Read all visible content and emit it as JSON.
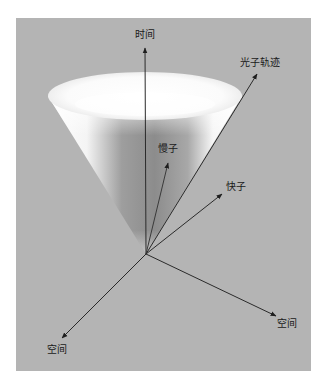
{
  "diagram": {
    "title": "",
    "background_color": "#b4b4b4",
    "labels": {
      "time_axis": "时间",
      "photon_path": "光子轨迹",
      "slow_particle": "慢子",
      "fast_particle": "快子",
      "space_axis_left": "空间",
      "space_axis_right": "空间"
    },
    "elements": [
      {
        "type": "cone",
        "name": "light-cone",
        "apex": [
          146,
          254
        ],
        "rim_center": [
          145,
          96
        ],
        "rim_rx": 97,
        "rim_ry": 24
      },
      {
        "type": "arrow",
        "name": "time-axis",
        "from": [
          146,
          254
        ],
        "to": [
          145,
          48
        ],
        "label": "时间"
      },
      {
        "type": "arrow",
        "name": "photon-trajectory",
        "from": [
          146,
          254
        ],
        "to": [
          257,
          74
        ],
        "label": "光子轨迹"
      },
      {
        "type": "arrow",
        "name": "slow-particle",
        "from": [
          146,
          254
        ],
        "to": [
          168,
          163
        ],
        "label": "慢子"
      },
      {
        "type": "arrow",
        "name": "fast-particle",
        "from": [
          146,
          254
        ],
        "to": [
          222,
          194
        ],
        "label": "快子"
      },
      {
        "type": "arrow",
        "name": "space-axis-left",
        "from": [
          146,
          254
        ],
        "to": [
          62,
          338
        ],
        "label": "空间"
      },
      {
        "type": "arrow",
        "name": "space-axis-right",
        "from": [
          146,
          254
        ],
        "to": [
          276,
          316
        ],
        "label": "空间"
      }
    ]
  }
}
